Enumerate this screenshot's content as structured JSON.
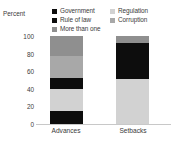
{
  "chart_data": {
    "type": "bar",
    "title": "",
    "subtitle": "",
    "xlabel": "",
    "ylabel": "Percent",
    "ylim": [
      0,
      100
    ],
    "yticks": [
      "0",
      "20",
      "40",
      "60",
      "80",
      "100"
    ],
    "grid": false,
    "stacked": true,
    "stack_total": 100,
    "legend_position": "top",
    "categories": [
      "Advances",
      "Setbacks"
    ],
    "series": [
      {
        "name": "Government",
        "color": "#0d0d0d",
        "values": [
          15,
          0
        ]
      },
      {
        "name": "Regulation",
        "color": "#d2d2d2",
        "values": [
          25,
          51
        ]
      },
      {
        "name": "Rule of law",
        "color": "#0d0d0d",
        "values": [
          12,
          41
        ]
      },
      {
        "name": "Corruption",
        "color": "#a8a8a8",
        "values": [
          25,
          0
        ]
      },
      {
        "name": "More than one",
        "color": "#8f8f8f",
        "values": [
          23,
          8
        ]
      }
    ],
    "stacks": {
      "Advances": [
        {
          "name": "Government",
          "from": 0,
          "to": 15,
          "color": "#0d0d0d"
        },
        {
          "name": "Regulation",
          "from": 15,
          "to": 40,
          "color": "#d2d2d2"
        },
        {
          "name": "Rule of law",
          "from": 40,
          "to": 52,
          "color": "#0d0d0d"
        },
        {
          "name": "Corruption",
          "from": 52,
          "to": 77,
          "color": "#a8a8a8"
        },
        {
          "name": "More than one",
          "from": 77,
          "to": 100,
          "color": "#8f8f8f"
        }
      ],
      "Setbacks": [
        {
          "name": "Regulation",
          "from": 0,
          "to": 51,
          "color": "#d2d2d2"
        },
        {
          "name": "Rule of law",
          "from": 51,
          "to": 92,
          "color": "#0d0d0d"
        },
        {
          "name": "More than one",
          "from": 92,
          "to": 100,
          "color": "#8f8f8f"
        }
      ]
    }
  },
  "legend": {
    "left_column": [
      {
        "label": "Government",
        "color": "#0d0d0d"
      },
      {
        "label": "Rule of law",
        "color": "#0d0d0d"
      },
      {
        "label": "More than one",
        "color": "#8f8f8f"
      }
    ],
    "right_column": [
      {
        "label": "Regulation",
        "color": "#d2d2d2"
      },
      {
        "label": "Corruption",
        "color": "#a8a8a8"
      }
    ]
  },
  "axis": {
    "y_title": "Percent",
    "y_ticks": [
      "100",
      "80",
      "60",
      "40",
      "20",
      "0"
    ],
    "x_labels": [
      "Advances",
      "Setbacks"
    ]
  }
}
